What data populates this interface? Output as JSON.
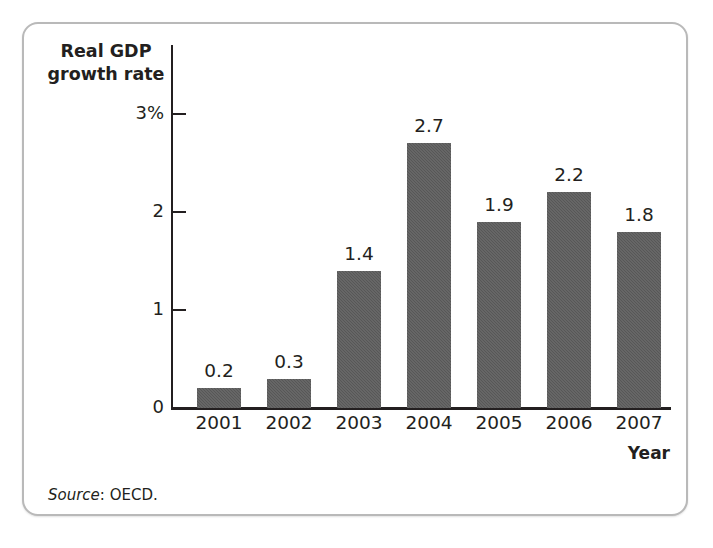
{
  "figure": {
    "title_line1": "Real GDP",
    "title_line2": "growth rate",
    "x_axis_title": "Year",
    "source_label": "Source",
    "source_text": ": OECD."
  },
  "chart_data": {
    "type": "bar",
    "title": "Real GDP growth rate",
    "xlabel": "Year",
    "ylabel": "Real GDP growth rate",
    "categories": [
      "2001",
      "2002",
      "2003",
      "2004",
      "2005",
      "2006",
      "2007"
    ],
    "values": [
      0.2,
      0.3,
      1.4,
      2.7,
      1.9,
      2.2,
      1.8
    ],
    "value_labels": [
      "0.2",
      "0.3",
      "1.4",
      "2.7",
      "1.9",
      "2.2",
      "1.8"
    ],
    "ylim": [
      0,
      3
    ],
    "y_ticks": [
      0,
      1,
      2,
      3
    ],
    "y_tick_labels": [
      "0",
      "1",
      "2",
      "3%"
    ],
    "grid": false,
    "legend": null,
    "bar_color": "#5c5c5c",
    "axis_color": "#231f20",
    "background_color": "#ffffff",
    "frame_color": "#b9b9b9",
    "source": "Source: OECD."
  }
}
